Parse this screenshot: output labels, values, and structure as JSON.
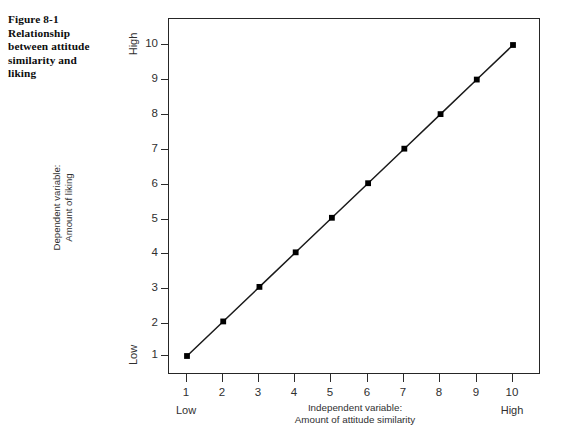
{
  "figure": {
    "caption_lines": [
      "Figure 8-1",
      "Relationship",
      "between attitude",
      "similarity and",
      "liking"
    ]
  },
  "chart_data": {
    "type": "line",
    "title": "",
    "subtitle": "",
    "xlabel_lines": [
      "Independent variable:",
      "Amount of attitude similarity"
    ],
    "ylabel_lines": [
      "Dependent variable:",
      "Amount of liking"
    ],
    "x": [
      1,
      2,
      3,
      4,
      5,
      6,
      7,
      8,
      9,
      10
    ],
    "values": [
      1,
      2,
      3,
      4,
      5,
      6,
      7,
      8,
      9,
      10
    ],
    "series": [
      {
        "name": "Amount of liking",
        "values": [
          1,
          2,
          3,
          4,
          5,
          6,
          7,
          8,
          9,
          10
        ]
      }
    ],
    "xlim": [
      0.5,
      10.5
    ],
    "ylim": [
      0.5,
      10.5
    ],
    "x_tick_labels": [
      "1",
      "2",
      "3",
      "4",
      "5",
      "6",
      "7",
      "8",
      "9",
      "10"
    ],
    "y_tick_labels": [
      "1",
      "2",
      "3",
      "4",
      "5",
      "6",
      "7",
      "8",
      "9",
      "10"
    ],
    "x_axis_endcap_low": "Low",
    "x_axis_endcap_high": "High",
    "y_axis_endcap_low": "Low",
    "y_axis_endcap_high": "High",
    "grid": false,
    "legend": false,
    "legend_position": "none",
    "marker": "square",
    "line_color": "#1a1a1a",
    "marker_color": "#000000",
    "frame_color": "#262626",
    "background_color": "#ffffff",
    "annotations": []
  },
  "axis_ticks": {
    "y": [
      {
        "label": "10",
        "top": 38
      },
      {
        "label": "9",
        "top": 73
      },
      {
        "label": "8",
        "top": 108
      },
      {
        "label": "7",
        "top": 143
      },
      {
        "label": "6",
        "top": 178
      },
      {
        "label": "5",
        "top": 213
      },
      {
        "label": "4",
        "top": 247
      },
      {
        "label": "3",
        "top": 282
      },
      {
        "label": "2",
        "top": 317
      },
      {
        "label": "1",
        "top": 349
      }
    ],
    "x": [
      {
        "label": "1",
        "left": 186
      },
      {
        "label": "2",
        "left": 222
      },
      {
        "label": "3",
        "left": 258
      },
      {
        "label": "4",
        "left": 294
      },
      {
        "label": "5",
        "left": 330
      },
      {
        "label": "6",
        "left": 367
      },
      {
        "label": "7",
        "left": 403
      },
      {
        "label": "8",
        "left": 439
      },
      {
        "label": "9",
        "left": 476
      },
      {
        "label": "10",
        "left": 512
      }
    ]
  }
}
